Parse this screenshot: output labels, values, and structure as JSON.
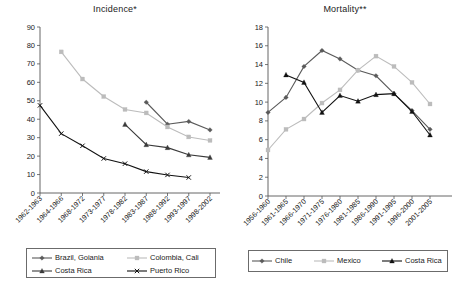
{
  "figure": {
    "width": 460,
    "height": 282,
    "background": "#ffffff"
  },
  "panels": [
    {
      "id": "incidence",
      "title": "Incidence*",
      "legend_entries": [
        "Brazil, Goiania",
        "Colombia, Cali",
        "Costa Rica",
        "Puerto Rico"
      ]
    },
    {
      "id": "mortality",
      "title": "Mortality**",
      "legend_entries": [
        "Chile",
        "Mexico",
        "Costa Rica"
      ]
    }
  ],
  "chart_data": [
    {
      "type": "line",
      "title": "Incidence*",
      "xlabel": "",
      "ylabel": "",
      "ylim": [
        0,
        90
      ],
      "ytick_step": 10,
      "yticks": [
        0,
        10,
        20,
        30,
        40,
        50,
        60,
        70,
        80,
        90
      ],
      "grid": false,
      "legend_position": "below",
      "categories": [
        "1962-1963",
        "1964-1966",
        "1968-1972",
        "1973-1977",
        "1978-1982",
        "1983-1987",
        "1988-1992",
        "1993-1997",
        "1998-2002"
      ],
      "series": [
        {
          "name": "Brazil, Goiania",
          "marker": "diamond",
          "color": "#5a5a5a",
          "values": [
            null,
            null,
            null,
            null,
            null,
            49.2,
            37.3,
            38.8,
            34.2
          ]
        },
        {
          "name": "Colombia, Cali",
          "marker": "square",
          "color": "#bcbcbc",
          "values": [
            null,
            76.5,
            61.8,
            52.3,
            45.3,
            43.4,
            35.8,
            30.4,
            28.5
          ]
        },
        {
          "name": "Costa Rica",
          "marker": "triangle",
          "color": "#3a3a3a",
          "values": [
            null,
            null,
            null,
            null,
            37.2,
            26.2,
            24.6,
            20.7,
            19.3
          ]
        },
        {
          "name": "Puerto Rico",
          "marker": "x",
          "color": "#111111",
          "values": [
            47.5,
            32.2,
            25.6,
            18.7,
            15.9,
            11.6,
            9.8,
            8.4,
            null
          ]
        }
      ]
    },
    {
      "type": "line",
      "title": "Mortality**",
      "xlabel": "",
      "ylabel": "",
      "ylim": [
        0,
        18
      ],
      "ytick_step": 2,
      "yticks": [
        0,
        2,
        4,
        6,
        8,
        10,
        12,
        14,
        16,
        18
      ],
      "grid": false,
      "legend_position": "below",
      "categories": [
        "1956-1960",
        "1961-1965",
        "1966-1970",
        "1971-1975",
        "1976-1980",
        "1981-1985",
        "1986-1990",
        "1991-1995",
        "1996-2000",
        "2001-2005"
      ],
      "series": [
        {
          "name": "Chile",
          "marker": "diamond",
          "color": "#5a5a5a",
          "values": [
            8.9,
            10.5,
            13.8,
            15.5,
            14.6,
            13.4,
            12.8,
            10.9,
            9.1,
            7.1
          ]
        },
        {
          "name": "Mexico",
          "marker": "square",
          "color": "#bcbcbc",
          "values": [
            4.9,
            7.1,
            8.2,
            9.9,
            11.3,
            13.4,
            14.9,
            13.8,
            12.1,
            9.8
          ]
        },
        {
          "name": "Costa Rica",
          "marker": "triangle",
          "color": "#111111",
          "values": [
            null,
            12.9,
            12.1,
            8.9,
            10.7,
            10.1,
            10.8,
            10.9,
            9.0,
            6.5
          ]
        }
      ]
    }
  ]
}
